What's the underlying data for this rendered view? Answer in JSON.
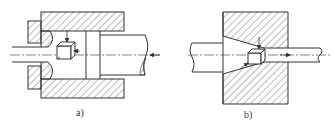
{
  "figure": {
    "panels": [
      {
        "id": "a",
        "label": "a)",
        "description": "Extrusion container with ram (right) pushing billet through die (left); stress element cube on axis; axis arrow pointing left"
      },
      {
        "id": "b",
        "label": "b)",
        "description": "Conical drawing die with rod passing through; stress element cube in deformation zone; axis arrow pointing right"
      }
    ],
    "colors": {
      "line": "#333333",
      "hatch": "#555555",
      "background": "#ffffff"
    }
  }
}
